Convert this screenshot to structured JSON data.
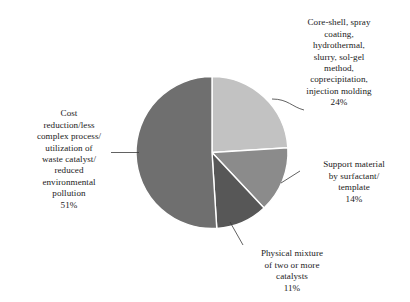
{
  "chart_data": {
    "type": "pie",
    "title": "",
    "subtitle": "",
    "xlabel": "",
    "ylabel": "",
    "legend_position": "none",
    "grid": false,
    "label_style": "leader-line callouts",
    "start_angle_deg": 0,
    "direction": "clockwise",
    "categories": [
      "Core-shell, spray coating, hydrothermal, slurry, sol-gel method, coprecipitation, injection molding",
      "Support material by surfactant/ template",
      "Physical mixture of two or more catalysts",
      "Cost reduction/less complex process/ utilization of waste catalyst/ reduced environmental pollution"
    ],
    "values": [
      24,
      14,
      11,
      51
    ],
    "value_unit": "%",
    "colors": [
      "#c2c2c2",
      "#8b8b8b",
      "#575757",
      "#6f6f6f"
    ],
    "slices": [
      {
        "name": "core-shell-methods",
        "label": "Core-shell, spray\ncoating,\nhydrothermal,\nslurry, sol-gel\nmethod,\ncoprecipitation,\ninjection molding",
        "percent": "24%",
        "value": 24,
        "color": "#c2c2c2"
      },
      {
        "name": "support-material-surfactant",
        "label": "Support material\nby surfactant/\ntemplate",
        "percent": "14%",
        "value": 14,
        "color": "#8b8b8b"
      },
      {
        "name": "physical-mixture",
        "label": "Physical mixture\nof two or more\ncatalysts",
        "percent": "11%",
        "value": 11,
        "color": "#575757"
      },
      {
        "name": "cost-reduction",
        "label": "Cost\nreduction/less\ncomplex process/\nutilization of\nwaste catalyst/\nreduced\nenvironmental\npollution",
        "percent": "51%",
        "value": 51,
        "color": "#6f6f6f"
      }
    ]
  },
  "figure": {
    "background": "#ffffff",
    "leader_line_color": "#3a3a3a",
    "slice_border_color": "#ffffff"
  }
}
